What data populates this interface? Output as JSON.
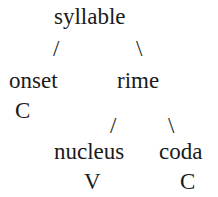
{
  "diagram": {
    "type": "syllable-structure-tree",
    "root": {
      "label": "syllable"
    },
    "level1": {
      "left_branch": "/",
      "right_branch": "\\",
      "onset": {
        "label": "onset",
        "symbol": "C"
      },
      "rime": {
        "label": "rime"
      }
    },
    "level2": {
      "left_branch": "/",
      "right_branch": "\\",
      "nucleus": {
        "label": "nucleus",
        "symbol": "V"
      },
      "coda": {
        "label": "coda",
        "symbol": "C"
      }
    }
  }
}
